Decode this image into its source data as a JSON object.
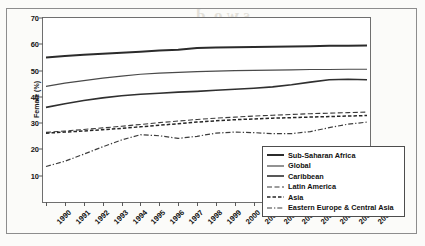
{
  "chart_data": {
    "type": "line",
    "title": "",
    "xlabel": "",
    "ylabel": "Female (%)",
    "ylim": [
      0,
      70
    ],
    "yticks": [
      10,
      20,
      30,
      40,
      50,
      60,
      70
    ],
    "grid": false,
    "legend_position": "lower-right",
    "x": [
      1990,
      1991,
      1992,
      1993,
      1994,
      1995,
      1996,
      1997,
      1998,
      1999,
      2000,
      2001,
      2002,
      2003,
      2004,
      2005,
      2006,
      2007
    ],
    "categories": [
      "1990",
      "1991",
      "1992",
      "1993",
      "1994",
      "1995",
      "1996",
      "1997",
      "1998",
      "1999",
      "2000",
      "2001",
      "2002",
      "2003",
      "2004",
      "2005",
      "2006",
      "2007"
    ],
    "series": [
      {
        "name": "Sub-Saharan Africa",
        "style": "solid",
        "width": 2.0,
        "color": "#2b2b2b",
        "values": [
          55.0,
          55.5,
          56.0,
          56.4,
          56.8,
          57.2,
          57.6,
          57.9,
          58.6,
          58.8,
          58.9,
          59.0,
          59.1,
          59.2,
          59.3,
          59.4,
          59.4,
          59.5
        ]
      },
      {
        "name": "Global",
        "style": "solid",
        "width": 1.2,
        "color": "#4a4a4a",
        "values": [
          44.0,
          45.2,
          46.2,
          47.1,
          47.9,
          48.6,
          49.0,
          49.3,
          49.6,
          49.8,
          50.0,
          50.1,
          50.2,
          50.3,
          50.4,
          50.4,
          50.5,
          50.5
        ]
      },
      {
        "name": "Caribbean",
        "style": "solid",
        "width": 1.6,
        "color": "#2f2f2f",
        "values": [
          36.0,
          37.4,
          38.6,
          39.6,
          40.4,
          41.0,
          41.4,
          41.8,
          42.1,
          42.5,
          42.9,
          43.3,
          43.8,
          44.6,
          45.6,
          46.5,
          46.7,
          46.5
        ]
      },
      {
        "name": "Latin America",
        "style": "dashed-long",
        "width": 1.1,
        "color": "#3a3a3a",
        "values": [
          26.5,
          27.0,
          27.6,
          28.2,
          28.8,
          29.5,
          30.2,
          30.8,
          31.4,
          31.9,
          32.3,
          32.7,
          33.0,
          33.3,
          33.6,
          33.8,
          34.0,
          34.2
        ]
      },
      {
        "name": "Asia",
        "style": "dashed-medium",
        "width": 1.5,
        "color": "#262626",
        "values": [
          26.2,
          26.6,
          27.0,
          27.5,
          28.0,
          28.6,
          29.2,
          29.8,
          30.4,
          30.9,
          31.3,
          31.6,
          31.9,
          32.1,
          32.3,
          32.5,
          32.7,
          32.9
        ]
      },
      {
        "name": "Eastern Europe & Central Asia",
        "style": "dash-dot",
        "width": 1.2,
        "color": "#3d3d3d",
        "values": [
          13.5,
          15.5,
          18.2,
          21.0,
          23.6,
          25.6,
          25.2,
          24.2,
          25.0,
          26.2,
          26.6,
          26.4,
          26.0,
          26.0,
          26.8,
          28.3,
          29.6,
          30.4
        ]
      }
    ]
  },
  "legend": {
    "items": [
      {
        "label": "Sub-Saharan Africa",
        "style": "solid"
      },
      {
        "label": "Global",
        "style": "solid"
      },
      {
        "label": "Caribbean",
        "style": "solid"
      },
      {
        "label": "Latin America",
        "style": "dashed-long"
      },
      {
        "label": "Asia",
        "style": "dashed-medium"
      },
      {
        "label": "Eastern Europe & Central Asia",
        "style": "dash-dot"
      }
    ]
  },
  "page_ghost_text": {
    "line1": "s w o ,d",
    "line2": "anssia in i 'nrnsi lgm",
    "line3": "eicn  s a a",
    "line4": "p e r  c e n t",
    "line5": ""
  }
}
